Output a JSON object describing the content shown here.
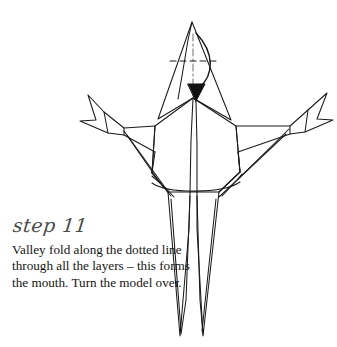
{
  "page": {
    "background_color": "#ffffff",
    "ink_color": "#1a1a1a",
    "heading_color": "#4a4a4a"
  },
  "caption": {
    "step_label": "step 11",
    "instruction_lines": [
      "Valley fold along the dotted line",
      "through all the layers – this forms",
      "the mouth. Turn the model over."
    ],
    "instruction_text": "Valley fold along the dotted line\nthrough all the layers – this forms\nthe mouth. Turn the model over."
  },
  "diagram": {
    "stroke_color": "#1a1a1a",
    "stroke_width": 1.05,
    "fold_line": {
      "type": "valley-fold-dotted",
      "orientation": "horizontal",
      "x1": 170,
      "y1": 61,
      "x2": 218,
      "y2": 61,
      "dash": "6 4"
    },
    "center_crease": {
      "type": "dash-dot-center-line",
      "x1": 193,
      "y1": 34,
      "x2": 193,
      "y2": 95,
      "dash": "7 3 2 3"
    },
    "arrow": {
      "type": "valley-fold-arrow",
      "path": "M 196 33 C 214 52 213 74 199 88",
      "head_tip_x": 196,
      "head_tip_y": 100,
      "head_width": 15,
      "head_height": 16
    },
    "head": {
      "apex_x": 192,
      "apex_y": 22,
      "left_base_x": 158,
      "left_base_y": 119,
      "right_base_x": 231,
      "right_base_y": 120
    },
    "body": {
      "top_y": 98,
      "waist_y": 192,
      "left_x": 155,
      "right_x": 238
    },
    "left_wing": {
      "tip_x": 88,
      "tip_y": 95,
      "elbow_x": 124,
      "elbow_y": 128
    },
    "right_wing": {
      "tip_x": 327,
      "tip_y": 93,
      "elbow_x": 290,
      "elbow_y": 126
    },
    "tail": {
      "left_point_x": 180,
      "right_point_x": 203,
      "bottom_y": 336
    }
  }
}
